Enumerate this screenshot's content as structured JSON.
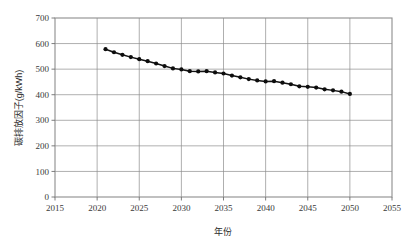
{
  "chart_data": {
    "type": "line",
    "title": "",
    "xlabel": "年份",
    "ylabel": "碳排放因子(g/kWh)",
    "xlim": [
      2015,
      2055
    ],
    "ylim": [
      0,
      700
    ],
    "xticks": [
      2015,
      2020,
      2025,
      2030,
      2035,
      2040,
      2045,
      2050,
      2055
    ],
    "yticks": [
      0,
      100,
      200,
      300,
      400,
      500,
      600,
      700
    ],
    "grid": true,
    "legend": null,
    "marker": "filled-circle",
    "marker_color": "#0d0d0d",
    "line_color": "#131313",
    "x": [
      2021,
      2022,
      2023,
      2024,
      2025,
      2026,
      2027,
      2028,
      2029,
      2030,
      2031,
      2032,
      2033,
      2034,
      2035,
      2036,
      2037,
      2038,
      2039,
      2040,
      2041,
      2042,
      2043,
      2044,
      2045,
      2046,
      2047,
      2048,
      2049,
      2050
    ],
    "values": [
      578,
      566,
      556,
      547,
      539,
      531,
      522,
      512,
      503,
      499,
      492,
      491,
      492,
      487,
      483,
      475,
      468,
      461,
      456,
      452,
      453,
      447,
      441,
      433,
      431,
      428,
      421,
      417,
      412,
      403
    ],
    "series": [
      {
        "name": "碳排放因子",
        "values": [
          578,
          566,
          556,
          547,
          539,
          531,
          522,
          512,
          503,
          499,
          492,
          491,
          492,
          487,
          483,
          475,
          468,
          461,
          456,
          452,
          453,
          447,
          441,
          433,
          431,
          428,
          421,
          417,
          412,
          403
        ]
      }
    ]
  },
  "axes": {
    "x_tick_labels": [
      "2015",
      "2020",
      "2025",
      "2030",
      "2035",
      "2040",
      "2045",
      "2050",
      "2055"
    ],
    "y_tick_labels": [
      "0",
      "100",
      "200",
      "300",
      "400",
      "500",
      "600",
      "700"
    ],
    "x_axis_title": "年份",
    "y_axis_title": "碳排放因子(g/kWh)"
  },
  "colors": {
    "frame": "#8d8d8d",
    "grid": "#8d8d8d",
    "series": "#0d0d0d",
    "text": "#3a3a3a",
    "background": "#ffffff"
  }
}
